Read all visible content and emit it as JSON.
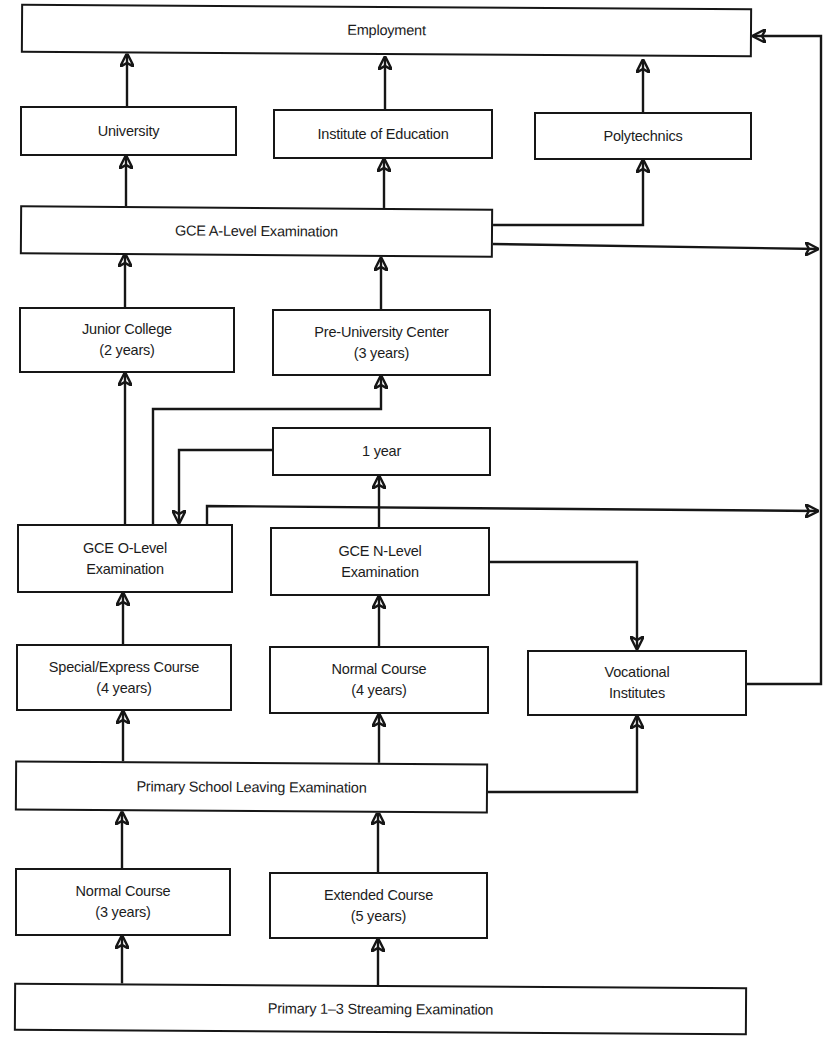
{
  "diagram": {
    "type": "flowchart",
    "title": "",
    "colors": {
      "line": "#161616",
      "text": "#1c1c1c",
      "background": "#ffffff"
    },
    "nodes": {
      "employment": {
        "line1": "Employment"
      },
      "university": {
        "line1": "University"
      },
      "institute_of_education": {
        "line1": "Institute of Education"
      },
      "polytechnics": {
        "line1": "Polytechnics"
      },
      "gce_a_level": {
        "line1": "GCE A-Level Examination"
      },
      "junior_college": {
        "line1": "Junior College",
        "line2": "(2 years)"
      },
      "pre_university_center": {
        "line1": "Pre-University Center",
        "line2": "(3 years)"
      },
      "one_year": {
        "line1": "1 year"
      },
      "gce_o_level": {
        "line1": "GCE O-Level",
        "line2": "Examination"
      },
      "gce_n_level": {
        "line1": "GCE N-Level",
        "line2": "Examination"
      },
      "special_express_course": {
        "line1": "Special/Express Course",
        "line2": "(4 years)"
      },
      "normal_course_4": {
        "line1": "Normal Course",
        "line2": "(4 years)"
      },
      "vocational_institutes": {
        "line1": "Vocational",
        "line2": "Institutes"
      },
      "psle": {
        "line1": "Primary School Leaving Examination"
      },
      "normal_course_3": {
        "line1": "Normal Course",
        "line2": "(3 years)"
      },
      "extended_course": {
        "line1": "Extended Course",
        "line2": "(5 years)"
      },
      "streaming_exam": {
        "line1": "Primary 1–3 Streaming Examination"
      }
    },
    "edges": [
      {
        "from": "streaming_exam",
        "to": "normal_course_3"
      },
      {
        "from": "streaming_exam",
        "to": "extended_course"
      },
      {
        "from": "normal_course_3",
        "to": "psle"
      },
      {
        "from": "extended_course",
        "to": "psle"
      },
      {
        "from": "psle",
        "to": "special_express_course"
      },
      {
        "from": "psle",
        "to": "normal_course_4"
      },
      {
        "from": "psle",
        "to": "vocational_institutes"
      },
      {
        "from": "special_express_course",
        "to": "gce_o_level"
      },
      {
        "from": "normal_course_4",
        "to": "gce_n_level"
      },
      {
        "from": "gce_n_level",
        "to": "one_year"
      },
      {
        "from": "gce_n_level",
        "to": "vocational_institutes"
      },
      {
        "from": "one_year",
        "to": "gce_o_level"
      },
      {
        "from": "gce_o_level",
        "to": "junior_college"
      },
      {
        "from": "gce_o_level",
        "to": "pre_university_center"
      },
      {
        "from": "gce_o_level",
        "to": "employment_bus"
      },
      {
        "from": "vocational_institutes",
        "to": "employment_bus"
      },
      {
        "from": "junior_college",
        "to": "gce_a_level"
      },
      {
        "from": "pre_university_center",
        "to": "gce_a_level"
      },
      {
        "from": "gce_a_level",
        "to": "university"
      },
      {
        "from": "gce_a_level",
        "to": "institute_of_education"
      },
      {
        "from": "gce_a_level",
        "to": "polytechnics"
      },
      {
        "from": "gce_a_level",
        "to": "employment_bus"
      },
      {
        "from": "university",
        "to": "employment"
      },
      {
        "from": "institute_of_education",
        "to": "employment"
      },
      {
        "from": "polytechnics",
        "to": "employment"
      },
      {
        "from": "employment_bus",
        "to": "employment"
      }
    ]
  }
}
